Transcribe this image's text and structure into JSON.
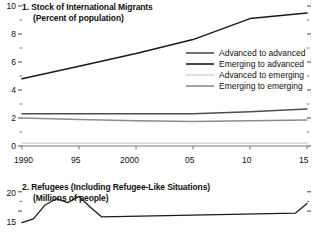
{
  "figure": {
    "background": "#ffffff",
    "text_color": "#111111"
  },
  "chart_data": [
    {
      "type": "line",
      "panel_number": "1.",
      "title": "1. Stock of International Migrants",
      "subtitle": "(Percent of population)",
      "xlabel": "",
      "ylabel": "",
      "grid": false,
      "legend_position": "center-right",
      "xlim": [
        1990,
        2015
      ],
      "ylim": [
        0,
        10
      ],
      "yticks": [
        0,
        2,
        4,
        6,
        8,
        10
      ],
      "ytick_labels": [
        "0",
        "2",
        "4",
        "6",
        "8",
        "10"
      ],
      "yminor_ticks": [
        1,
        3,
        5,
        7,
        9
      ],
      "x": [
        1990,
        1995,
        2000,
        2005,
        2010,
        2015
      ],
      "xtick_labels": [
        "1990",
        "95",
        "2000",
        "05",
        "10",
        "15"
      ],
      "series": [
        {
          "name": "Advanced to advanced",
          "color": "#4d4d4d",
          "values": [
            2.3,
            2.3,
            2.3,
            2.3,
            2.45,
            2.65
          ]
        },
        {
          "name": "Emerging to advanced",
          "color": "#1a1a1a",
          "values": [
            4.8,
            5.7,
            6.6,
            7.6,
            9.1,
            9.5
          ]
        },
        {
          "name": "Advanced to emerging",
          "color": "#d6d6d6",
          "values": [
            0.2,
            0.2,
            0.2,
            0.2,
            0.2,
            0.2
          ]
        },
        {
          "name": "Emerging to emerging",
          "color": "#8c8c8c",
          "values": [
            2.0,
            1.9,
            1.8,
            1.75,
            1.8,
            1.85
          ]
        }
      ]
    },
    {
      "type": "line",
      "panel_number": "2.",
      "title": "2. Refugees (Including Refugee-Like Situations)",
      "subtitle": "(Millions of people)",
      "xlabel": "",
      "ylabel": "",
      "grid": false,
      "legend_position": "none",
      "xlim": [
        1990,
        2015
      ],
      "ylim": [
        0,
        20
      ],
      "yticks": [
        15,
        20
      ],
      "ytick_labels": [
        "15",
        "20"
      ],
      "yminor_ticks": [
        17.5
      ],
      "x": [
        1990,
        1991,
        1992,
        1993,
        1994,
        1995,
        1996,
        1997,
        2014,
        2015
      ],
      "series": [
        {
          "name": "Refugees",
          "color": "#1a1a1a",
          "values": [
            12.0,
            13.0,
            16.5,
            18.2,
            17.2,
            18.8,
            16.0,
            13.5,
            14.5,
            17.0
          ]
        }
      ]
    }
  ],
  "panel1": {
    "title": "1. Stock of International Migrants",
    "subtitle": "(Percent of population)",
    "ytick_labels": [
      "10",
      "8",
      "6",
      "4",
      "2",
      "0"
    ],
    "xtick_labels": [
      "1990",
      "95",
      "2000",
      "05",
      "10",
      "15"
    ],
    "legend": [
      {
        "label": "Advanced to advanced",
        "color": "#4d4d4d"
      },
      {
        "label": "Emerging to advanced",
        "color": "#1a1a1a"
      },
      {
        "label": "Advanced to emerging",
        "color": "#d6d6d6"
      },
      {
        "label": "Emerging to emerging",
        "color": "#8c8c8c"
      }
    ]
  },
  "panel2": {
    "title": "2. Refugees (Including Refugee-Like Situations)",
    "subtitle": "(Millions of people)",
    "ytick_labels": [
      "20",
      "15"
    ]
  }
}
